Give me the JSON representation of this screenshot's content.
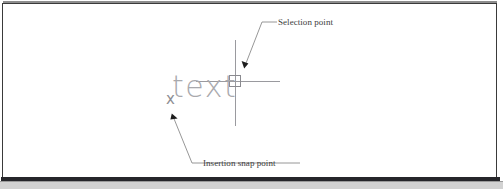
{
  "figure": {
    "type": "cad-diagram",
    "background_color": "#ffffff",
    "frame_color": "#3a3a3a",
    "entity_color": "#a9a9ad",
    "annotation_color": "#3d3d3d"
  },
  "drawing": {
    "text_entity": "text",
    "insertion_marker": "x",
    "pickbox": "selection-pickbox",
    "crosshair": {
      "horizontal": {
        "x1": 196,
        "x2": 280,
        "y": 81
      },
      "vertical": {
        "x": 235,
        "y1": 40,
        "y2": 126
      }
    }
  },
  "annotations": [
    {
      "id": "selection-point",
      "label": "Selection point",
      "leader": {
        "tail_x": 277,
        "tail_y": 22,
        "elbow_x": 262,
        "elbow_y": 22,
        "tip_x": 244,
        "tip_y": 67
      }
    },
    {
      "id": "insertion-snap-point",
      "label": "Insertion snap point",
      "leader": {
        "tail_x": 200,
        "tail_y": 163,
        "elbow_x": 192,
        "elbow_y": 163,
        "tip_x": 172,
        "tip_y": 114
      }
    }
  ]
}
